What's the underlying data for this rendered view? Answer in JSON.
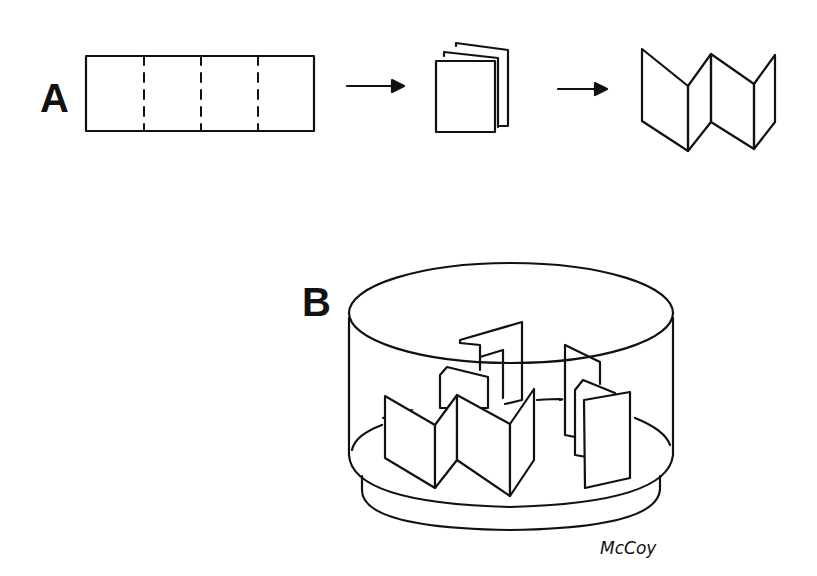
{
  "figure": {
    "panel_a": {
      "label": "A",
      "steps": [
        "flat strip with 3 dashed fold lines",
        "folded stack",
        "unfolded zig-zag"
      ]
    },
    "panel_b": {
      "label": "B",
      "description": "cylindrical dish containing zig-zag folded strips"
    },
    "signature": "McCoy",
    "colors": {
      "ink": "#111111",
      "background": "#ffffff"
    }
  }
}
